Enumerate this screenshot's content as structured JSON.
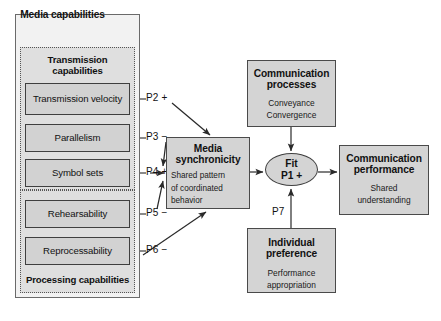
{
  "media_capabilities": {
    "label": "Media capabilities",
    "transmission_group": {
      "label": "Transmission capabilities",
      "items": [
        {
          "label": "Transmission velocity",
          "proposition": "P2 +"
        },
        {
          "label": "Parallelism",
          "proposition": "P3 −"
        },
        {
          "label": "Symbol sets",
          "proposition": "P4 +"
        }
      ]
    },
    "processing_group": {
      "label": "Processing capabilities",
      "items": [
        {
          "label": "Rehearsability",
          "proposition": "P5 −"
        },
        {
          "label": "Reprocessability",
          "proposition": "P6 −"
        }
      ]
    }
  },
  "nodes": {
    "media_synchronicity": {
      "title": "Media synchronicity",
      "sub_line1": "Shared pattern",
      "sub_line2": "of coordinated",
      "sub_line3": "behavior"
    },
    "communication_processes": {
      "title": "Communication processes",
      "sub_line1": "Conveyance",
      "sub_line2": "Convergence"
    },
    "communication_performance": {
      "title": "Communication performance",
      "sub_line1": "Shared",
      "sub_line2": "understanding"
    },
    "individual_preference": {
      "title": "Individual preference",
      "sub_line1": "Performance",
      "sub_line2": "appropriation"
    },
    "fit": {
      "line1": "Fit",
      "line2": "P1 +"
    }
  },
  "edge_labels": {
    "p2": "P2 +",
    "p3": "P3 −",
    "p4": "P4 +",
    "p5": "P5 −",
    "p6": "P6 −",
    "p7": "P7"
  },
  "colors": {
    "node_fill": "#d4d4d4",
    "group_fill": "#dfdfdf",
    "container_fill": "#f2f2f2",
    "stroke": "#3f3f3f",
    "text": "#111111"
  }
}
